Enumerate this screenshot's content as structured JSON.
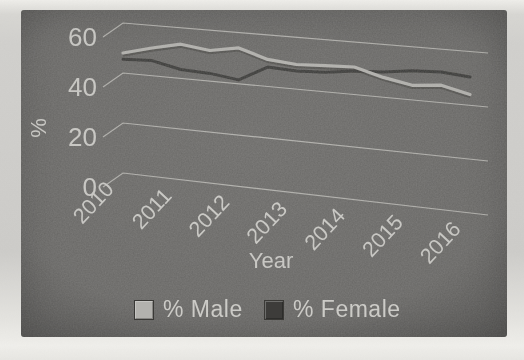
{
  "page": {
    "background_top": "#e8e7e3",
    "background_mid": "#cbcac7",
    "background_bottom": "#eceae6"
  },
  "chart": {
    "panel_color": "#6c6b69",
    "text_color": "#cbcac6",
    "gridline_color": "#b8b7b3",
    "colors": {
      "male": "#b3b2ae",
      "female": "#3d3c3a",
      "male_shadow": "#45443f"
    },
    "legend": {
      "male_label": "% Male",
      "female_label": "% Female"
    }
  },
  "chart_data": {
    "type": "line",
    "style": "3d-perspective",
    "title": "",
    "xlabel": "Year",
    "ylabel": "%",
    "x_tick_labels": [
      "2010",
      "2011",
      "2012",
      "2013",
      "2014",
      "2015",
      "2016"
    ],
    "y_ticks": [
      0,
      20,
      40,
      60
    ],
    "ylim": [
      0,
      60
    ],
    "xlim": [
      2010,
      2016
    ],
    "grid": true,
    "legend_position": "bottom",
    "x": [
      2010,
      2010.5,
      2011,
      2011.5,
      2012,
      2012.5,
      2013,
      2013.5,
      2014,
      2014.5,
      2015,
      2015.5,
      2016
    ],
    "series": [
      {
        "name": "% Male",
        "values": [
          48,
          51,
          53.5,
          52,
          54,
          50.5,
          49.5,
          50,
          50.5,
          47.5,
          45.5,
          46.5,
          44
        ]
      },
      {
        "name": "% Female",
        "values": [
          45.5,
          46,
          43.5,
          43,
          41.5,
          47.5,
          47,
          47.5,
          49,
          49.5,
          51,
          51.5,
          50.5
        ]
      }
    ]
  }
}
